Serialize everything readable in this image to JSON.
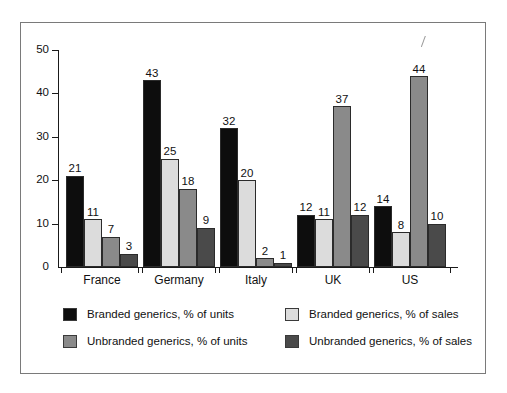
{
  "chart_data": {
    "type": "bar",
    "title": "",
    "xlabel": "",
    "ylabel": "",
    "ylim": [
      0,
      50
    ],
    "yticks": [
      0,
      10,
      20,
      30,
      40,
      50
    ],
    "grid": false,
    "legend_position": "bottom",
    "categories": [
      "France",
      "Germany",
      "Italy",
      "UK",
      "US"
    ],
    "series": [
      {
        "name": "Branded generics, % of units",
        "color": "#0d0d0d",
        "values": [
          21,
          43,
          32,
          12,
          14
        ]
      },
      {
        "name": "Branded generics, % of sales",
        "color": "#dcdcdc",
        "values": [
          11,
          25,
          20,
          11,
          8
        ]
      },
      {
        "name": "Unbranded generics, % of units",
        "color": "#8a8a8a",
        "values": [
          7,
          18,
          2,
          37,
          44
        ]
      },
      {
        "name": "Unbranded generics, % of sales",
        "color": "#4a4a4a",
        "values": [
          3,
          9,
          1,
          12,
          10
        ]
      }
    ]
  },
  "axis": {
    "y_tick_labels": [
      "0",
      "10",
      "20",
      "30",
      "40",
      "50"
    ]
  },
  "legend": {
    "items": [
      {
        "label": "Branded generics, % of units",
        "color": "#0d0d0d"
      },
      {
        "label": "Branded generics, % of sales",
        "color": "#dcdcdc"
      },
      {
        "label": "Unbranded generics, % of units",
        "color": "#8a8a8a"
      },
      {
        "label": "Unbranded generics, % of sales",
        "color": "#4a4a4a"
      }
    ]
  }
}
